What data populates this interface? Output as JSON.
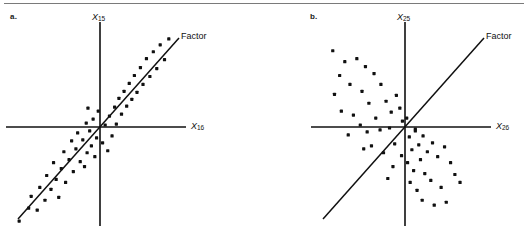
{
  "figure": {
    "width": 528,
    "height": 242,
    "background": "#ffffff",
    "rule_color": "#7a7a7a",
    "ink_color": "#101010"
  },
  "panels": [
    {
      "id": "a",
      "label": "a.",
      "y_axis_label_main": "X",
      "y_axis_label_sub": "15",
      "x_axis_label_main": "X",
      "x_axis_label_sub": "16",
      "factor_label": "Factor"
    },
    {
      "id": "b",
      "label": "b.",
      "y_axis_label_main": "X",
      "y_axis_label_sub": "25",
      "x_axis_label_main": "X",
      "x_axis_label_sub": "26",
      "factor_label": "Factor"
    }
  ],
  "chart_data": [
    {
      "type": "scatter",
      "panel": "a",
      "title": "a.",
      "xlabel": "X16",
      "ylabel": "X15",
      "xlim": [
        -10,
        10
      ],
      "ylim": [
        -10,
        10
      ],
      "grid": false,
      "legend": null,
      "annotations": [
        {
          "text": "Factor",
          "x": 8.9,
          "y": 9.0,
          "role": "factor-axis-label"
        }
      ],
      "reference_line": {
        "name": "Factor",
        "type": "line",
        "slope": 1.0,
        "intercept": 0.0,
        "x_from": -9.6,
        "x_to": 8.7
      },
      "description": "Points lie in a tight elongated band along the Factor line: strong positive correlation between X15 and X16.",
      "points": [
        [
          -9.4,
          -9.5
        ],
        [
          -8.3,
          -8.2
        ],
        [
          -8.0,
          -7.0
        ],
        [
          -7.3,
          -8.4
        ],
        [
          -7.0,
          -6.1
        ],
        [
          -6.4,
          -7.4
        ],
        [
          -6.2,
          -4.9
        ],
        [
          -5.7,
          -6.3
        ],
        [
          -5.4,
          -3.6
        ],
        [
          -5.1,
          -5.3
        ],
        [
          -4.8,
          -7.1
        ],
        [
          -4.5,
          -4.2
        ],
        [
          -4.2,
          -2.5
        ],
        [
          -4.0,
          -5.6
        ],
        [
          -3.6,
          -3.3
        ],
        [
          -3.3,
          -1.4
        ],
        [
          -3.1,
          -4.5
        ],
        [
          -2.8,
          -2.2
        ],
        [
          -2.6,
          -0.6
        ],
        [
          -2.3,
          -3.5
        ],
        [
          -2.0,
          -1.3
        ],
        [
          -1.8,
          -4.0
        ],
        [
          -1.5,
          -2.6
        ],
        [
          -1.2,
          -0.4
        ],
        [
          -1.0,
          -1.9
        ],
        [
          -0.8,
          0.8
        ],
        [
          -0.6,
          -3.0
        ],
        [
          -0.4,
          -1.1
        ],
        [
          -0.2,
          1.6
        ],
        [
          -1.4,
          1.9
        ],
        [
          -1.6,
          0.4
        ],
        [
          0.3,
          -1.6
        ],
        [
          0.6,
          0.2
        ],
        [
          0.9,
          -2.4
        ],
        [
          1.1,
          1.1
        ],
        [
          1.4,
          -0.9
        ],
        [
          1.7,
          2.0
        ],
        [
          1.9,
          0.3
        ],
        [
          2.2,
          2.9
        ],
        [
          2.5,
          1.3
        ],
        [
          2.8,
          3.6
        ],
        [
          3.1,
          2.1
        ],
        [
          3.4,
          4.4
        ],
        [
          3.7,
          2.8
        ],
        [
          4.0,
          5.2
        ],
        [
          4.3,
          3.5
        ],
        [
          4.7,
          6.0
        ],
        [
          5.0,
          4.3
        ],
        [
          5.4,
          6.9
        ],
        [
          5.8,
          5.1
        ],
        [
          6.2,
          7.6
        ],
        [
          6.6,
          5.9
        ],
        [
          7.0,
          8.3
        ],
        [
          7.5,
          6.8
        ],
        [
          8.0,
          8.9
        ]
      ]
    },
    {
      "type": "scatter",
      "panel": "b",
      "title": "b.",
      "xlabel": "X26",
      "ylabel": "X25",
      "xlim": [
        -10,
        10
      ],
      "ylim": [
        -10,
        10
      ],
      "grid": false,
      "legend": null,
      "annotations": [
        {
          "text": "Factor",
          "x": 8.9,
          "y": 9.0,
          "role": "factor-axis-label"
        }
      ],
      "reference_line": {
        "name": "Factor",
        "type": "line",
        "slope": 1.0,
        "intercept": 0.0,
        "x_from": -9.6,
        "x_to": 8.7
      },
      "description": "Points form two clouds straddling the Factor line in the upper-left and lower-right quadrants: negative correlation between X25 and X26, orthogonal to the Factor.",
      "points": [
        [
          -8.4,
          7.7
        ],
        [
          -7.0,
          6.6
        ],
        [
          -7.6,
          5.2
        ],
        [
          -5.6,
          6.9
        ],
        [
          -4.6,
          6.1
        ],
        [
          -6.4,
          4.3
        ],
        [
          -5.0,
          3.6
        ],
        [
          -8.2,
          3.3
        ],
        [
          -3.6,
          5.4
        ],
        [
          -4.2,
          2.4
        ],
        [
          -7.4,
          1.6
        ],
        [
          -6.0,
          1.2
        ],
        [
          -2.8,
          4.3
        ],
        [
          -5.2,
          0.2
        ],
        [
          -3.4,
          0.9
        ],
        [
          -2.2,
          2.6
        ],
        [
          -6.6,
          -0.8
        ],
        [
          -4.4,
          -0.5
        ],
        [
          -2.9,
          -0.3
        ],
        [
          -1.6,
          1.5
        ],
        [
          -1.0,
          3.2
        ],
        [
          -0.6,
          1.9
        ],
        [
          -0.3,
          0.6
        ],
        [
          -1.8,
          -0.1
        ],
        [
          -3.9,
          -1.9
        ],
        [
          -2.5,
          -2.6
        ],
        [
          -1.2,
          -1.7
        ],
        [
          -4.8,
          -2.2
        ],
        [
          -0.4,
          -2.9
        ],
        [
          -1.4,
          -4.0
        ],
        [
          -2.0,
          -5.2
        ],
        [
          0.5,
          -1.0
        ],
        [
          0.8,
          -2.3
        ],
        [
          1.2,
          -0.4
        ],
        [
          1.6,
          -1.8
        ],
        [
          0.3,
          -3.6
        ],
        [
          2.1,
          -0.9
        ],
        [
          2.6,
          -2.5
        ],
        [
          1.0,
          -4.4
        ],
        [
          1.8,
          -3.3
        ],
        [
          3.2,
          -1.6
        ],
        [
          0.6,
          -5.6
        ],
        [
          2.3,
          -4.7
        ],
        [
          3.8,
          -3.0
        ],
        [
          1.4,
          -6.4
        ],
        [
          4.6,
          -2.0
        ],
        [
          3.0,
          -5.4
        ],
        [
          5.3,
          -3.6
        ],
        [
          2.0,
          -7.4
        ],
        [
          4.2,
          -6.1
        ],
        [
          5.8,
          -4.8
        ],
        [
          3.4,
          -7.9
        ],
        [
          6.4,
          -5.6
        ],
        [
          4.8,
          -7.6
        ],
        [
          1.2,
          -0.2
        ],
        [
          0.2,
          0.9
        ]
      ]
    }
  ]
}
